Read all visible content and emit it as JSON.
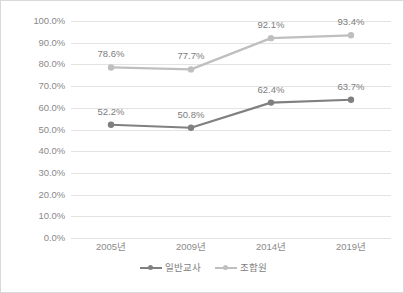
{
  "chart_data": {
    "type": "line",
    "title": "",
    "subtitle": "",
    "xlabel": "",
    "ylabel": "",
    "categories": [
      "2005년",
      "2009년",
      "2014년",
      "2019년"
    ],
    "series": [
      {
        "name": "일반교사",
        "color": "#808080",
        "values": [
          52.2,
          50.8,
          62.4,
          63.7
        ],
        "labels": [
          "52.2%",
          "50.8%",
          "62.4%",
          "63.7%"
        ]
      },
      {
        "name": "조합원",
        "color": "#bfbfbf",
        "values": [
          78.6,
          77.7,
          92.1,
          93.4
        ],
        "labels": [
          "78.6%",
          "77.7%",
          "92.1%",
          "93.4%"
        ]
      }
    ],
    "ylim": [
      0,
      100
    ],
    "ytick_values": [
      100,
      90,
      80,
      70,
      60,
      50,
      40,
      30,
      20,
      10,
      0
    ],
    "ytick_labels": [
      "100.0%",
      "90.0%",
      "80.0%",
      "70.0%",
      "60.0%",
      "50.0%",
      "40.0%",
      "30.0%",
      "20.0%",
      "10.0%",
      "0.0%"
    ],
    "grid": true,
    "grid_color": "#e3e3e3",
    "legend_position": "bottom",
    "data_labels_shown": true,
    "background_color": "#ffffff",
    "border_color": "#d9d9d9",
    "axis_text_color": "#8a8a8a"
  }
}
